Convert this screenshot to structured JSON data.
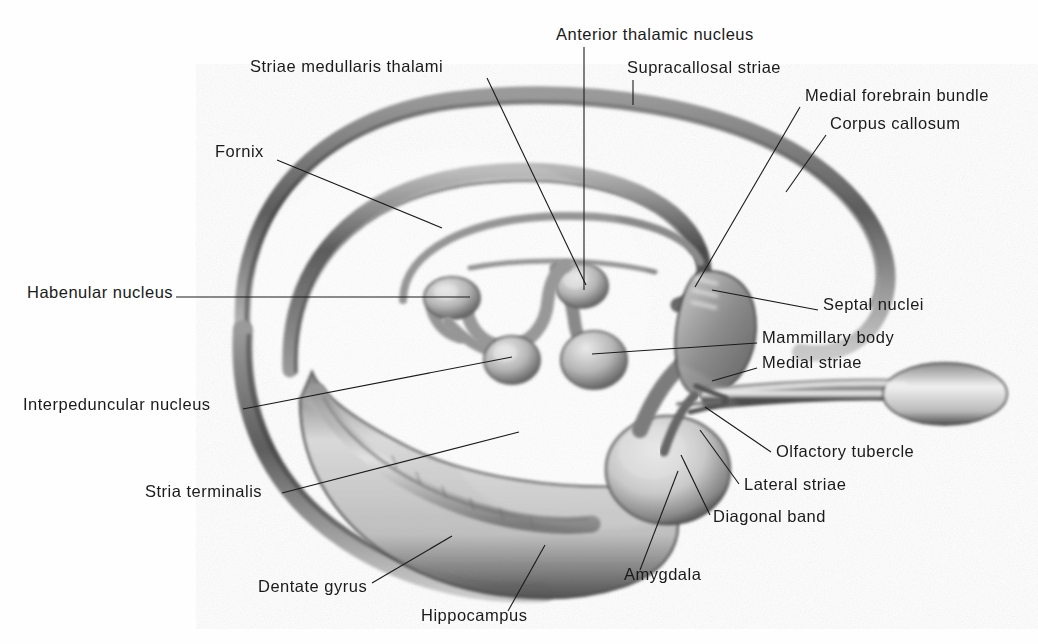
{
  "figure": {
    "kind": "anatomical-illustration",
    "background_color": "#fefefe",
    "ink_color": "#1a1a1a",
    "label_count": 17
  },
  "labels": [
    {
      "id": "anterior-thalamic-nucleus",
      "text": "Anterior thalamic nucleus",
      "x": 556,
      "y": 38,
      "align": "left",
      "leader": [
        [
          584,
          47
        ],
        [
          584,
          290
        ]
      ]
    },
    {
      "id": "supracallosal-striae",
      "text": "Supracallosal striae",
      "x": 627,
      "y": 71,
      "align": "left",
      "leader": [
        [
          633,
          80
        ],
        [
          633,
          105
        ]
      ]
    },
    {
      "id": "striae-medullaris-thalami",
      "text": "Striae medullaris thalami",
      "x": 250,
      "y": 70,
      "align": "left",
      "leader": [
        [
          487,
          78
        ],
        [
          586,
          285
        ]
      ]
    },
    {
      "id": "medial-forebrain-bundle",
      "text": "Medial forebrain bundle",
      "x": 805,
      "y": 99,
      "align": "left",
      "leader": [
        [
          800,
          107
        ],
        [
          695,
          287
        ]
      ]
    },
    {
      "id": "corpus-callosum",
      "text": "Corpus callosum",
      "x": 830,
      "y": 127,
      "align": "left",
      "leader": [
        [
          826,
          135
        ],
        [
          786,
          192
        ]
      ]
    },
    {
      "id": "fornix",
      "text": "Fornix",
      "x": 215,
      "y": 155,
      "align": "left",
      "leader": [
        [
          277,
          160
        ],
        [
          442,
          228
        ]
      ]
    },
    {
      "id": "habenular-nucleus",
      "text": "Habenular nucleus",
      "x": 27,
      "y": 296,
      "align": "left",
      "leader": [
        [
          176,
          297
        ],
        [
          470,
          297
        ]
      ]
    },
    {
      "id": "septal-nuclei",
      "text": "Septal nuclei",
      "x": 823,
      "y": 308,
      "align": "left",
      "leader": [
        [
          818,
          310
        ],
        [
          712,
          290
        ]
      ]
    },
    {
      "id": "mammillary-body",
      "text": "Mammillary body",
      "x": 762,
      "y": 341,
      "align": "left",
      "leader": [
        [
          757,
          343
        ],
        [
          592,
          354
        ]
      ]
    },
    {
      "id": "medial-striae",
      "text": "Medial striae",
      "x": 762,
      "y": 366,
      "align": "left",
      "leader": [
        [
          757,
          368
        ],
        [
          712,
          381
        ]
      ]
    },
    {
      "id": "interpeduncular-nucleus",
      "text": "Interpeduncular nucleus",
      "x": 23,
      "y": 408,
      "align": "left",
      "leader": [
        [
          243,
          409
        ],
        [
          512,
          357
        ]
      ]
    },
    {
      "id": "olfactory-tubercle",
      "text": "Olfactory tubercle",
      "x": 776,
      "y": 455,
      "align": "left",
      "leader": [
        [
          771,
          452
        ],
        [
          705,
          407
        ]
      ]
    },
    {
      "id": "lateral-striae",
      "text": "Lateral striae",
      "x": 744,
      "y": 488,
      "align": "left",
      "leader": [
        [
          739,
          484
        ],
        [
          700,
          430
        ]
      ]
    },
    {
      "id": "stria-terminalis",
      "text": "Stria terminalis",
      "x": 145,
      "y": 495,
      "align": "left",
      "leader": [
        [
          282,
          493
        ],
        [
          519,
          432
        ]
      ]
    },
    {
      "id": "diagonal-band",
      "text": "Diagonal band",
      "x": 713,
      "y": 520,
      "align": "left",
      "leader": [
        [
          710,
          515
        ],
        [
          681,
          455
        ]
      ]
    },
    {
      "id": "amygdala",
      "text": "Amygdala",
      "x": 624,
      "y": 578,
      "align": "left",
      "leader": [
        [
          640,
          570
        ],
        [
          678,
          471
        ]
      ]
    },
    {
      "id": "dentate-gyrus",
      "text": "Dentate gyrus",
      "x": 258,
      "y": 590,
      "align": "left",
      "leader": [
        [
          372,
          583
        ],
        [
          452,
          536
        ]
      ]
    },
    {
      "id": "hippocampus",
      "text": "Hippocampus",
      "x": 421,
      "y": 619,
      "align": "left",
      "leader": [
        [
          508,
          611
        ],
        [
          545,
          545
        ]
      ]
    }
  ],
  "structures": [
    {
      "id": "corpus-callosum-arc",
      "name": "Corpus callosum"
    },
    {
      "id": "fornix-arc",
      "name": "Fornix"
    },
    {
      "id": "hippocampus-body",
      "name": "Hippocampus"
    },
    {
      "id": "dentate-gyrus-band",
      "name": "Dentate gyrus"
    },
    {
      "id": "amygdala-mass",
      "name": "Amygdala"
    },
    {
      "id": "olfactory-bulb",
      "name": "Olfactory bulb and tract"
    },
    {
      "id": "septal-region",
      "name": "Septal nuclei"
    },
    {
      "id": "mammillary-body-knob",
      "name": "Mammillary body"
    },
    {
      "id": "habenular-nucleus-knob",
      "name": "Habenular nucleus"
    },
    {
      "id": "interpeduncular-nucleus-knob",
      "name": "Interpeduncular nucleus"
    },
    {
      "id": "anterior-thalamic-knob",
      "name": "Anterior thalamic nucleus"
    },
    {
      "id": "stria-medullaris-band",
      "name": "Stria medullaris thalami"
    }
  ]
}
